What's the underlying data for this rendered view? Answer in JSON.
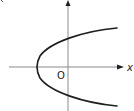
{
  "diagram": {
    "labels": {
      "x_axis": "x",
      "origin": "O"
    },
    "colors": {
      "axis": "#8a8a8a",
      "curve": "#1e1e1e",
      "text": "#222222"
    },
    "geometry": {
      "origin_px": [
        68,
        67
      ],
      "vertex_px": [
        36,
        67
      ],
      "y_axis_intercepts_px": [
        41,
        93
      ],
      "curve_ends_px": [
        [
          117,
          28
        ],
        [
          117,
          106
        ]
      ]
    }
  }
}
